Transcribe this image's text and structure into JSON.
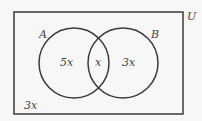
{
  "diagram": {
    "type": "venn",
    "universe_label": "U",
    "sets": [
      {
        "label": "A",
        "only_region": "5x"
      },
      {
        "label": "B",
        "only_region": "3x"
      }
    ],
    "intersection": "x",
    "outside": "3x",
    "colors": {
      "stroke": "#3a3a3a",
      "background": "#f7f7f7",
      "text": "#444444"
    }
  }
}
